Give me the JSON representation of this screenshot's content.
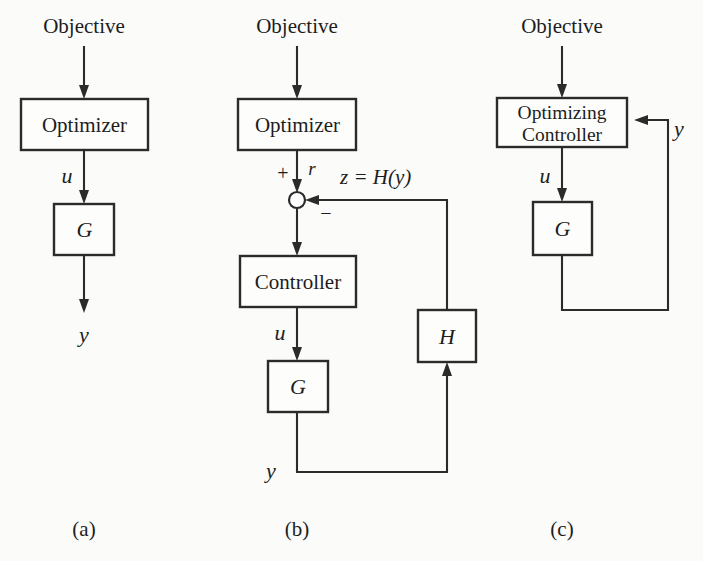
{
  "figure": {
    "background_color": "#fbfbfa",
    "line_color": "#2b2b2b",
    "text_color": "#1d1d1d",
    "panels": [
      {
        "id": "a",
        "caption": "(a)",
        "blocks": [
          {
            "name": "optimizer",
            "label": "Optimizer"
          },
          {
            "name": "plant",
            "label": "G"
          }
        ],
        "signals": [
          {
            "name": "objective",
            "label": "Objective"
          },
          {
            "name": "control-input",
            "label": "u"
          },
          {
            "name": "output",
            "label": "y"
          }
        ]
      },
      {
        "id": "b",
        "caption": "(b)",
        "blocks": [
          {
            "name": "optimizer",
            "label": "Optimizer"
          },
          {
            "name": "controller",
            "label": "Controller"
          },
          {
            "name": "plant",
            "label": "G"
          },
          {
            "name": "sensor",
            "label": "H"
          }
        ],
        "signals": [
          {
            "name": "objective",
            "label": "Objective"
          },
          {
            "name": "reference",
            "label": "r"
          },
          {
            "name": "control-input",
            "label": "u"
          },
          {
            "name": "output",
            "label": "y"
          },
          {
            "name": "feedback-relation",
            "label": "z = H(y)"
          }
        ],
        "summing_junction": {
          "name": "summing-junction",
          "positive_sign": "+",
          "negative_sign": "−"
        }
      },
      {
        "id": "c",
        "caption": "(c)",
        "blocks": [
          {
            "name": "optimizing-controller",
            "label_line1": "Optimizing",
            "label_line2": "Controller"
          },
          {
            "name": "plant",
            "label": "G"
          }
        ],
        "signals": [
          {
            "name": "objective",
            "label": "Objective"
          },
          {
            "name": "control-input",
            "label": "u"
          },
          {
            "name": "output",
            "label": "y"
          }
        ]
      }
    ]
  }
}
